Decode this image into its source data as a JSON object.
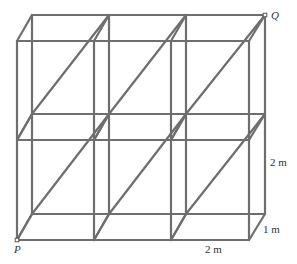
{
  "figure": {
    "points": {
      "P": "P",
      "Q": "Q"
    },
    "dimensions": {
      "width": "2 m",
      "height": "2 m",
      "depth": "1 m"
    },
    "colors": {
      "rod": "#6e6e6e",
      "text": "#333333"
    },
    "grid": {
      "front_x": [
        17,
        94,
        171,
        249
      ],
      "front_y": [
        41,
        140,
        240
      ],
      "back_x": [
        32,
        109,
        186,
        265
      ],
      "back_y": [
        15,
        114,
        214
      ]
    }
  }
}
